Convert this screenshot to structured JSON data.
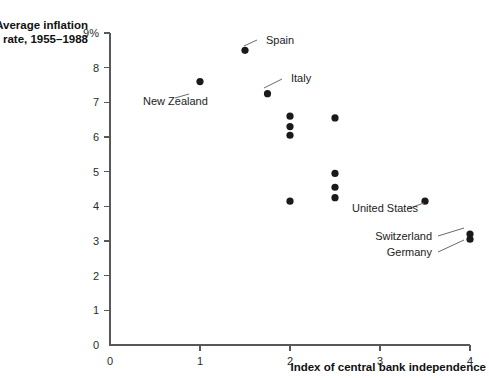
{
  "chart_data": {
    "type": "scatter",
    "title": "",
    "xlabel": "Index of central bank independence",
    "ylabel_line1": "Average inflation",
    "ylabel_line2": "rate, 1955–1988",
    "xlim": [
      0,
      4
    ],
    "ylim": [
      0,
      9
    ],
    "grid": false,
    "legend": "none",
    "xticks": [
      "0",
      "1",
      "2",
      "3",
      "4"
    ],
    "xtick_values": [
      0,
      1,
      2,
      3,
      4
    ],
    "yticks": [
      "0",
      "1",
      "2",
      "3",
      "4",
      "5",
      "6",
      "7",
      "8",
      "9%"
    ],
    "ytick_values": [
      0,
      1,
      2,
      3,
      4,
      5,
      6,
      7,
      8,
      9
    ],
    "marker_color": "#1a1a1a",
    "axis_color": "#58585a",
    "points": [
      {
        "x": 1.5,
        "y": 8.5,
        "label": "Spain"
      },
      {
        "x": 1.0,
        "y": 7.6,
        "label": "New Zealand"
      },
      {
        "x": 1.75,
        "y": 7.25,
        "label": "Italy"
      },
      {
        "x": 2.0,
        "y": 6.6,
        "label": ""
      },
      {
        "x": 2.0,
        "y": 6.3,
        "label": ""
      },
      {
        "x": 2.0,
        "y": 6.05,
        "label": ""
      },
      {
        "x": 2.5,
        "y": 6.55,
        "label": ""
      },
      {
        "x": 2.5,
        "y": 4.95,
        "label": ""
      },
      {
        "x": 2.5,
        "y": 4.55,
        "label": ""
      },
      {
        "x": 2.5,
        "y": 4.25,
        "label": ""
      },
      {
        "x": 2.0,
        "y": 4.15,
        "label": ""
      },
      {
        "x": 3.5,
        "y": 4.15,
        "label": "United States"
      },
      {
        "x": 4.0,
        "y": 3.2,
        "label": "Switzerland"
      },
      {
        "x": 4.0,
        "y": 3.05,
        "label": "Germany"
      }
    ],
    "annotations": [
      {
        "label": "Spain",
        "text_x": 266,
        "text_y": 44,
        "anchor": "start",
        "line_x1": 257,
        "line_y1": 40,
        "line_x2": 244,
        "line_y2": 46
      },
      {
        "label": "New Zealand",
        "text_x": 143,
        "text_y": 105,
        "anchor": "start",
        "line_x1": 189,
        "line_y1": 94,
        "line_x2": 175,
        "line_y2": 98
      },
      {
        "label": "Italy",
        "text_x": 291,
        "text_y": 82,
        "anchor": "start",
        "line_x1": 282,
        "line_y1": 79,
        "line_x2": 264,
        "line_y2": 88
      },
      {
        "label": "United States",
        "text_x": 352,
        "text_y": 212,
        "anchor": "start",
        "line_x1": 424,
        "line_y1": 203,
        "line_x2": 407,
        "line_y2": 209
      },
      {
        "label": "Switzerland",
        "text_x": 432,
        "text_y": 240,
        "anchor": "end",
        "line_x1": 438,
        "line_y1": 236,
        "line_x2": 464,
        "line_y2": 228
      },
      {
        "label": "Germany",
        "text_x": 432,
        "text_y": 256,
        "anchor": "end",
        "line_x1": 438,
        "line_y1": 252,
        "line_x2": 464,
        "line_y2": 240
      }
    ]
  }
}
